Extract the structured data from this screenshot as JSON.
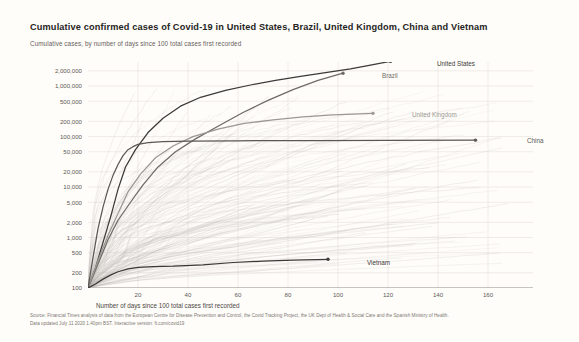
{
  "header": {
    "title": "Cumulative confirmed cases of Covid-19 in United States, Brazil, United Kingdom, China and Vietnam",
    "subtitle": "Cumulative cases, by number of days since 100 total cases first recorded"
  },
  "footer": {
    "line1": "Source: Financial Times analysis of data from the European Centre for Disease Prevention and Control, the Covid Tracking Project, the UK Dept of Health & Social Care and the Spanish Ministry of Health.",
    "line2": "Data updated July 11 2020 1.40pm BST. Interactive version: ft.com/covid19"
  },
  "colors": {
    "background": "#fffdfa",
    "highlight": "#3b3a38",
    "secondary": "#8e8a86",
    "faint": "#bdb9b4",
    "grid": "#e8e4df",
    "axis": "#8a8682",
    "text": "#33302e",
    "muted": "#66615c"
  },
  "chart_data": {
    "type": "line",
    "title": "Cumulative confirmed cases of Covid-19 in United States, Brazil, United Kingdom, China and Vietnam",
    "subtitle": "Cumulative cases, by number of days since 100 total cases first recorded",
    "xlabel": "Number of days since 100 total cases first recorded",
    "ylabel": "",
    "yscale": "log",
    "xlim": [
      0,
      178
    ],
    "ylim": [
      100,
      3000000
    ],
    "grid": true,
    "legend_position": "inline-end-labels",
    "yticks": [
      100,
      200,
      500,
      1000,
      2000,
      5000,
      10000,
      20000,
      50000,
      100000,
      200000,
      500000,
      1000000,
      2000000
    ],
    "ytick_labels": [
      "100",
      "200",
      "500",
      "1,000",
      "2,000",
      "5,000",
      "10,000",
      "20,000",
      "50,000",
      "100,000",
      "200,000",
      "500,000",
      "1,000,000",
      "2,000,000"
    ],
    "xticks": [
      20,
      40,
      60,
      80,
      100,
      120,
      140,
      160
    ],
    "xtick_labels": [
      "20",
      "40",
      "60",
      "80",
      "100",
      "120",
      "140",
      "160"
    ],
    "series": [
      {
        "name": "United States",
        "label": "United States",
        "emphasis": "high",
        "color": "#3b3a38",
        "end_x": 121,
        "end_y": 3100000,
        "points": [
          [
            0,
            100
          ],
          [
            3,
            250
          ],
          [
            6,
            800
          ],
          [
            9,
            2500
          ],
          [
            12,
            9000
          ],
          [
            15,
            25000
          ],
          [
            19,
            55000
          ],
          [
            24,
            120000
          ],
          [
            30,
            230000
          ],
          [
            37,
            400000
          ],
          [
            45,
            600000
          ],
          [
            55,
            820000
          ],
          [
            65,
            1050000
          ],
          [
            75,
            1300000
          ],
          [
            85,
            1550000
          ],
          [
            95,
            1850000
          ],
          [
            105,
            2200000
          ],
          [
            113,
            2600000
          ],
          [
            121,
            3100000
          ]
        ]
      },
      {
        "name": "Brazil",
        "label": "Brazil",
        "emphasis": "high",
        "color": "#6e6a66",
        "end_x": 102,
        "end_y": 1800000,
        "points": [
          [
            0,
            100
          ],
          [
            4,
            300
          ],
          [
            8,
            900
          ],
          [
            12,
            2200
          ],
          [
            17,
            5000
          ],
          [
            22,
            11000
          ],
          [
            28,
            25000
          ],
          [
            35,
            50000
          ],
          [
            43,
            90000
          ],
          [
            52,
            160000
          ],
          [
            62,
            300000
          ],
          [
            72,
            520000
          ],
          [
            82,
            850000
          ],
          [
            92,
            1300000
          ],
          [
            102,
            1800000
          ]
        ]
      },
      {
        "name": "United Kingdom",
        "label": "United Kingdom",
        "emphasis": "high",
        "color": "#9c9893",
        "end_x": 114,
        "end_y": 288000,
        "points": [
          [
            0,
            100
          ],
          [
            4,
            350
          ],
          [
            8,
            1100
          ],
          [
            12,
            3000
          ],
          [
            16,
            8000
          ],
          [
            21,
            18000
          ],
          [
            27,
            38000
          ],
          [
            34,
            65000
          ],
          [
            42,
            100000
          ],
          [
            52,
            140000
          ],
          [
            62,
            180000
          ],
          [
            74,
            215000
          ],
          [
            86,
            245000
          ],
          [
            98,
            268000
          ],
          [
            114,
            288000
          ]
        ]
      },
      {
        "name": "China",
        "label": "China",
        "emphasis": "high",
        "color": "#5a5754",
        "end_x": 155,
        "end_y": 85000,
        "points": [
          [
            0,
            100
          ],
          [
            2,
            400
          ],
          [
            4,
            1500
          ],
          [
            6,
            4000
          ],
          [
            8,
            9000
          ],
          [
            10,
            17000
          ],
          [
            12,
            28000
          ],
          [
            14,
            42000
          ],
          [
            16,
            55000
          ],
          [
            18,
            63000
          ],
          [
            20,
            70000
          ],
          [
            24,
            76000
          ],
          [
            30,
            79000
          ],
          [
            40,
            81000
          ],
          [
            60,
            82500
          ],
          [
            90,
            83500
          ],
          [
            120,
            84500
          ],
          [
            155,
            85000
          ]
        ]
      },
      {
        "name": "Vietnam",
        "label": "Vietnam",
        "emphasis": "high",
        "color": "#3b3a38",
        "end_x": 96,
        "end_y": 370,
        "points": [
          [
            0,
            100
          ],
          [
            3,
            120
          ],
          [
            6,
            150
          ],
          [
            9,
            180
          ],
          [
            12,
            210
          ],
          [
            16,
            240
          ],
          [
            20,
            255
          ],
          [
            26,
            265
          ],
          [
            34,
            270
          ],
          [
            46,
            288
          ],
          [
            58,
            320
          ],
          [
            70,
            340
          ],
          [
            82,
            355
          ],
          [
            96,
            370
          ]
        ]
      }
    ],
    "background_series_count": 190,
    "background_series_note": "Faint grey lines for all other countries"
  },
  "series_labels": [
    {
      "name": "United States",
      "x": 432,
      "y": 64
    },
    {
      "name": "Brazil",
      "x": 377,
      "y": 76
    },
    {
      "name": "United Kingdom",
      "x": 407,
      "y": 115
    },
    {
      "name": "China",
      "x": 522,
      "y": 141
    },
    {
      "name": "Vietnam",
      "x": 362,
      "y": 263
    }
  ]
}
